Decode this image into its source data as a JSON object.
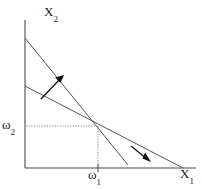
{
  "figure": {
    "type": "line-diagram",
    "title": "",
    "background_color": "#ffffff",
    "stroke_color": "#4a4a4a",
    "text_color": "#1a1a1a",
    "axes": {
      "vertical": {
        "name": "x2-axis",
        "label_text": "X",
        "label_subscript": "2",
        "x": 25,
        "y_top": 20,
        "y_bottom": 168
      },
      "horizontal": {
        "name": "x1-axis",
        "label_text": "X",
        "label_subscript": "1",
        "y": 168,
        "x_left": 25,
        "x_right": 196
      }
    },
    "ticks": [
      {
        "name": "omega-2-tick",
        "axis": "vertical",
        "label_text": "ω",
        "label_subscript": "2",
        "value_position": 126
      },
      {
        "name": "omega-1-tick",
        "axis": "horizontal",
        "label_text": "ω",
        "label_subscript": "1",
        "value_position": 98
      }
    ],
    "lines": [
      {
        "name": "steep-budget-line",
        "x1": 25,
        "y1": 38,
        "x2": 128,
        "y2": 165,
        "stroke_width": 1
      },
      {
        "name": "flat-budget-line",
        "x1": 25,
        "y1": 86,
        "x2": 183,
        "y2": 168,
        "stroke_width": 1
      }
    ],
    "intersection_point": {
      "x": 98,
      "y": 126
    },
    "guides": [
      {
        "name": "horizontal-dotted-guide",
        "x1": 26,
        "y1": 126,
        "x2": 98,
        "y2": 126
      },
      {
        "name": "vertical-dotted-guide",
        "x1": 98,
        "y1": 126,
        "x2": 98,
        "y2": 168
      }
    ],
    "arrows": [
      {
        "name": "up-right-arrow",
        "x1": 42,
        "y1": 98,
        "x2": 63,
        "y2": 76,
        "direction": "up-right"
      },
      {
        "name": "down-right-arrow",
        "x1": 131,
        "y1": 146,
        "x2": 150,
        "y2": 161,
        "direction": "down-right"
      }
    ]
  }
}
